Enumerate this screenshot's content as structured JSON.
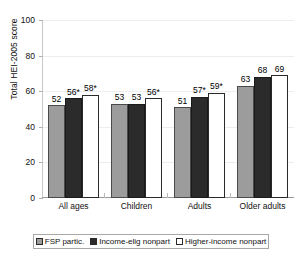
{
  "chart_data": {
    "type": "bar",
    "title": "",
    "xlabel": "",
    "ylabel": "Total HEI-2005 score",
    "ylim": [
      0,
      100
    ],
    "yticks": [
      0,
      20,
      40,
      60,
      80,
      100
    ],
    "grid": true,
    "legend_position": "bottom",
    "categories": [
      "All ages",
      "Children",
      "Adults",
      "Older adults"
    ],
    "series": [
      {
        "name": "FSP partic.",
        "color": "#9c9c9c",
        "values": [
          52,
          53,
          51,
          63
        ],
        "labels": [
          "52",
          "53",
          "51",
          "63"
        ]
      },
      {
        "name": "Income-elig nonpart",
        "color": "#2b2b2b",
        "values": [
          56,
          53,
          57,
          68
        ],
        "labels": [
          "56*",
          "53",
          "57*",
          "68"
        ]
      },
      {
        "name": "Higher-income nonpart",
        "color": "#ffffff",
        "values": [
          58,
          56,
          59,
          69
        ],
        "labels": [
          "58*",
          "56*",
          "59*",
          "69"
        ]
      }
    ]
  }
}
